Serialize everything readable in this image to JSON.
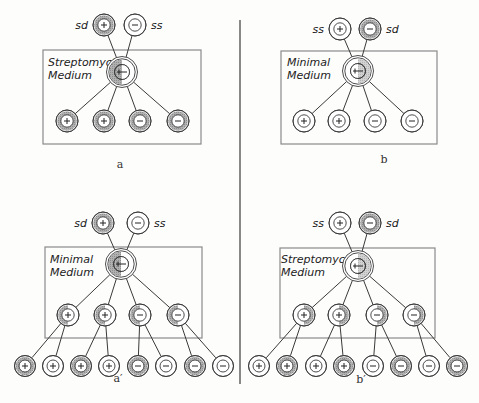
{
  "figure": {
    "colors": {
      "shade": "#9c9c9c",
      "shade_light": "#c4c4c4",
      "ink": "#2a2a2a",
      "background": "#fdfdfc",
      "box": "#8a8a8a"
    },
    "divider": {
      "x": 240,
      "y1": 20,
      "y2": 384
    },
    "panels": [
      {
        "id": "a",
        "label": "a",
        "label_pos": [
          120,
          168
        ],
        "box": {
          "x": 43,
          "y": 50,
          "w": 158,
          "h": 94
        },
        "medium": [
          "Streptomycin",
          "Medium"
        ],
        "medium_pos": [
          48,
          66
        ],
        "parents": [
          {
            "x": 104,
            "y": 25,
            "sign": "+",
            "shade": "full",
            "strain": "sd",
            "strain_side": "left"
          },
          {
            "x": 135,
            "y": 25,
            "sign": "-",
            "shade": "none",
            "strain": "ss",
            "strain_side": "right"
          }
        ],
        "zygote": {
          "x": 122,
          "y": 72,
          "shade": "left"
        },
        "children": [
          {
            "x": 67,
            "y": 121,
            "sign": "+",
            "shade": "full"
          },
          {
            "x": 104,
            "y": 121,
            "sign": "+",
            "shade": "full"
          },
          {
            "x": 140,
            "y": 121,
            "sign": "-",
            "shade": "full"
          },
          {
            "x": 178,
            "y": 121,
            "sign": "-",
            "shade": "full"
          }
        ],
        "grandchildren": []
      },
      {
        "id": "b",
        "label": "b",
        "label_pos": [
          384,
          163
        ],
        "box": {
          "x": 281,
          "y": 51,
          "w": 156,
          "h": 93
        },
        "medium": [
          "Minimal",
          "Medium"
        ],
        "medium_pos": [
          287,
          66
        ],
        "parents": [
          {
            "x": 340,
            "y": 29,
            "sign": "+",
            "shade": "none",
            "strain": "ss",
            "strain_side": "left"
          },
          {
            "x": 370,
            "y": 29,
            "sign": "-",
            "shade": "full",
            "strain": "sd",
            "strain_side": "right"
          }
        ],
        "zygote": {
          "x": 358,
          "y": 71,
          "shade": "right"
        },
        "children": [
          {
            "x": 304,
            "y": 121,
            "sign": "+",
            "shade": "none"
          },
          {
            "x": 339,
            "y": 121,
            "sign": "+",
            "shade": "none"
          },
          {
            "x": 375,
            "y": 121,
            "sign": "-",
            "shade": "none"
          },
          {
            "x": 412,
            "y": 121,
            "sign": "-",
            "shade": "none"
          }
        ],
        "grandchildren": []
      },
      {
        "id": "a-prime",
        "label": "a′",
        "label_pos": [
          118,
          382
        ],
        "box": {
          "x": 45,
          "y": 247,
          "w": 157,
          "h": 91
        },
        "medium": [
          "Minimal",
          "Medium"
        ],
        "medium_pos": [
          50,
          263
        ],
        "parents": [
          {
            "x": 103,
            "y": 223,
            "sign": "+",
            "shade": "full",
            "strain": "sd",
            "strain_side": "left"
          },
          {
            "x": 138,
            "y": 223,
            "sign": "-",
            "shade": "none",
            "strain": "ss",
            "strain_side": "right"
          }
        ],
        "zygote": {
          "x": 121,
          "y": 264,
          "shade": "left"
        },
        "children": [
          {
            "x": 68,
            "y": 315,
            "sign": "+",
            "shade": "left"
          },
          {
            "x": 105,
            "y": 315,
            "sign": "+",
            "shade": "left"
          },
          {
            "x": 140,
            "y": 315,
            "sign": "-",
            "shade": "left"
          },
          {
            "x": 178,
            "y": 315,
            "sign": "-",
            "shade": "left"
          }
        ],
        "grandchildren": [
          {
            "x": 25,
            "y": 366,
            "sign": "+",
            "shade": "full",
            "parent": 0
          },
          {
            "x": 53,
            "y": 366,
            "sign": "+",
            "shade": "none",
            "parent": 0
          },
          {
            "x": 81,
            "y": 366,
            "sign": "+",
            "shade": "full",
            "parent": 1
          },
          {
            "x": 109,
            "y": 366,
            "sign": "+",
            "shade": "none",
            "parent": 1
          },
          {
            "x": 138,
            "y": 366,
            "sign": "-",
            "shade": "full",
            "parent": 2
          },
          {
            "x": 166,
            "y": 366,
            "sign": "-",
            "shade": "none",
            "parent": 2
          },
          {
            "x": 195,
            "y": 366,
            "sign": "-",
            "shade": "full",
            "parent": 3
          },
          {
            "x": 223,
            "y": 366,
            "sign": "-",
            "shade": "none",
            "parent": 3
          }
        ]
      },
      {
        "id": "b-prime",
        "label": "b′",
        "label_pos": [
          361,
          383
        ],
        "box": {
          "x": 280,
          "y": 248,
          "w": 155,
          "h": 90
        },
        "medium": [
          "Streptomycin",
          "Medium"
        ],
        "medium_pos": [
          281,
          263
        ],
        "parents": [
          {
            "x": 340,
            "y": 223,
            "sign": "+",
            "shade": "none",
            "strain": "ss",
            "strain_side": "left"
          },
          {
            "x": 370,
            "y": 223,
            "sign": "-",
            "shade": "full",
            "strain": "sd",
            "strain_side": "right"
          }
        ],
        "zygote": {
          "x": 358,
          "y": 266,
          "shade": "right"
        },
        "children": [
          {
            "x": 304,
            "y": 315,
            "sign": "+",
            "shade": "right"
          },
          {
            "x": 339,
            "y": 315,
            "sign": "+",
            "shade": "right"
          },
          {
            "x": 377,
            "y": 315,
            "sign": "-",
            "shade": "right"
          },
          {
            "x": 414,
            "y": 315,
            "sign": "-",
            "shade": "right"
          }
        ],
        "grandchildren": [
          {
            "x": 259,
            "y": 366,
            "sign": "+",
            "shade": "none",
            "parent": 0
          },
          {
            "x": 287,
            "y": 366,
            "sign": "+",
            "shade": "full",
            "parent": 0
          },
          {
            "x": 316,
            "y": 366,
            "sign": "+",
            "shade": "none",
            "parent": 1
          },
          {
            "x": 344,
            "y": 366,
            "sign": "+",
            "shade": "full",
            "parent": 1
          },
          {
            "x": 373,
            "y": 366,
            "sign": "-",
            "shade": "none",
            "parent": 2
          },
          {
            "x": 401,
            "y": 366,
            "sign": "-",
            "shade": "full",
            "parent": 2
          },
          {
            "x": 429,
            "y": 366,
            "sign": "-",
            "shade": "none",
            "parent": 3
          },
          {
            "x": 457,
            "y": 366,
            "sign": "-",
            "shade": "full",
            "parent": 3
          }
        ]
      }
    ]
  }
}
